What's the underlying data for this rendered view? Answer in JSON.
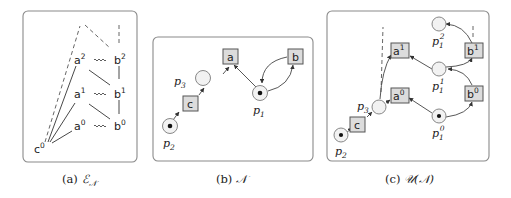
{
  "figure": {
    "panels": [
      {
        "id": "a",
        "caption_prefix": "(a)",
        "caption_math": "ℰ",
        "caption_sub": "𝒩",
        "events": [
          {
            "name": "c",
            "sup": "0"
          },
          {
            "name": "a",
            "sup": "0"
          },
          {
            "name": "a",
            "sup": "1"
          },
          {
            "name": "a",
            "sup": "2"
          },
          {
            "name": "b",
            "sup": "0"
          },
          {
            "name": "b",
            "sup": "1"
          },
          {
            "name": "b",
            "sup": "2"
          }
        ],
        "relations": {
          "causality": [
            [
              "c0",
              "a0"
            ],
            [
              "c0",
              "a1"
            ],
            [
              "c0",
              "a2"
            ],
            [
              "b0",
              "b1"
            ],
            [
              "b1",
              "b2"
            ],
            [
              "a1",
              "b0"
            ],
            [
              "a2",
              "b1"
            ]
          ],
          "conflict": [
            [
              "a0",
              "b0"
            ],
            [
              "a1",
              "b1"
            ],
            [
              "a2",
              "b2"
            ]
          ],
          "continuation_dashed": [
            "c0",
            "b2"
          ]
        }
      },
      {
        "id": "b",
        "caption_prefix": "(b)",
        "caption_math": "𝒩",
        "transitions": [
          "a",
          "b",
          "c"
        ],
        "places": [
          {
            "name": "p",
            "sub": "1",
            "tokens": 1
          },
          {
            "name": "p",
            "sub": "2",
            "tokens": 1
          },
          {
            "name": "p",
            "sub": "3",
            "tokens": 0
          }
        ],
        "arcs": [
          [
            "p2",
            "c"
          ],
          [
            "c",
            "p3"
          ],
          [
            "p3",
            "a"
          ],
          [
            "p1",
            "a"
          ],
          [
            "p1",
            "b"
          ],
          [
            "b",
            "p1"
          ]
        ]
      },
      {
        "id": "c",
        "caption_prefix": "(c)",
        "caption_math": "𝒰(𝒩)",
        "transitions": [
          {
            "name": "c",
            "sup": ""
          },
          {
            "name": "a",
            "sup": "0"
          },
          {
            "name": "a",
            "sup": "1"
          },
          {
            "name": "b",
            "sup": "0"
          },
          {
            "name": "b",
            "sup": "1"
          }
        ],
        "places": [
          {
            "name": "p",
            "sub": "2",
            "sup": "",
            "tokens": 1
          },
          {
            "name": "p",
            "sub": "3",
            "sup": "",
            "tokens": 0
          },
          {
            "name": "p",
            "sub": "1",
            "sup": "0",
            "tokens": 1
          },
          {
            "name": "p",
            "sub": "1",
            "sup": "1",
            "tokens": 0
          },
          {
            "name": "p",
            "sub": "1",
            "sup": "2",
            "tokens": 0
          }
        ]
      }
    ]
  },
  "labels": {
    "a": {
      "c": "c",
      "a": "a",
      "b": "b",
      "s0": "0",
      "s1": "1",
      "s2": "2"
    },
    "b": {
      "a": "a",
      "b": "b",
      "c": "c",
      "p": "p",
      "s1": "1",
      "s2": "2",
      "s3": "3"
    },
    "c": {
      "a": "a",
      "b": "b",
      "c": "c",
      "p": "p",
      "s0": "0",
      "s1": "1",
      "s2": "2",
      "s3": "3"
    }
  },
  "captions": {
    "a_prefix": "(a) ",
    "a_math": "ℰ",
    "a_sub": "𝒩",
    "b_prefix": "(b) ",
    "b_math": "𝒩",
    "c_prefix": "(c) ",
    "c_math": "𝒰(𝒩)"
  }
}
